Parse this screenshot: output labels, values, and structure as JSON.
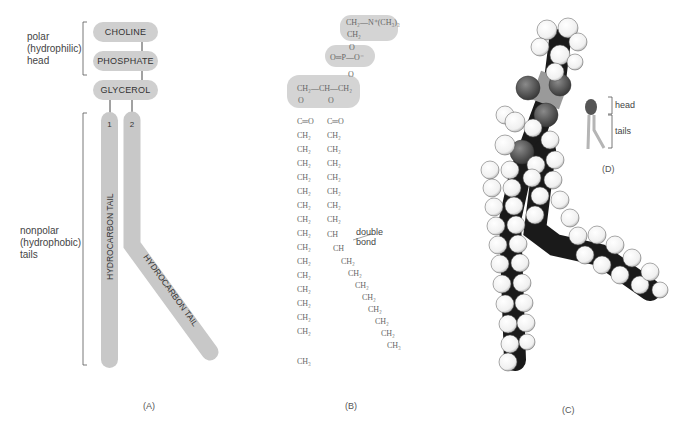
{
  "panel_a": {
    "letter": "(A)",
    "head_label": [
      "polar",
      "(hydrophilic)",
      "head"
    ],
    "tail_label": [
      "nonpolar",
      "(hydrophobic)",
      "tails"
    ],
    "groups": [
      "CHOLINE",
      "PHOSPHATE",
      "GLYCEROL"
    ],
    "tail_numbers": [
      "1",
      "2"
    ],
    "tail_text": "HYDROCARBON TAIL",
    "fill_color": "#c8c8c8"
  },
  "panel_b": {
    "letter": "(B)",
    "choline_line1": "CH₂—N⁺(CH₃)₃",
    "choline_line2": "CH₂",
    "phosphate_o_top": "O",
    "phosphate_line": "O═P—O⁻",
    "phosphate_o_bottom": "O",
    "glycerol_line": "CH₂—CH—CH₂",
    "ester_o": "O",
    "carbonyl": "C═O",
    "ch2": "CH₂",
    "ch": "CH",
    "ch3": "CH₃",
    "double_bond_label": [
      "double",
      "bond"
    ]
  },
  "panel_c": {
    "letter": "(C)"
  },
  "panel_d": {
    "letter": "(D)",
    "head_label": "head",
    "tails_label": "tails",
    "head_color": "#555555",
    "tail_color": "#b5b5b5"
  }
}
